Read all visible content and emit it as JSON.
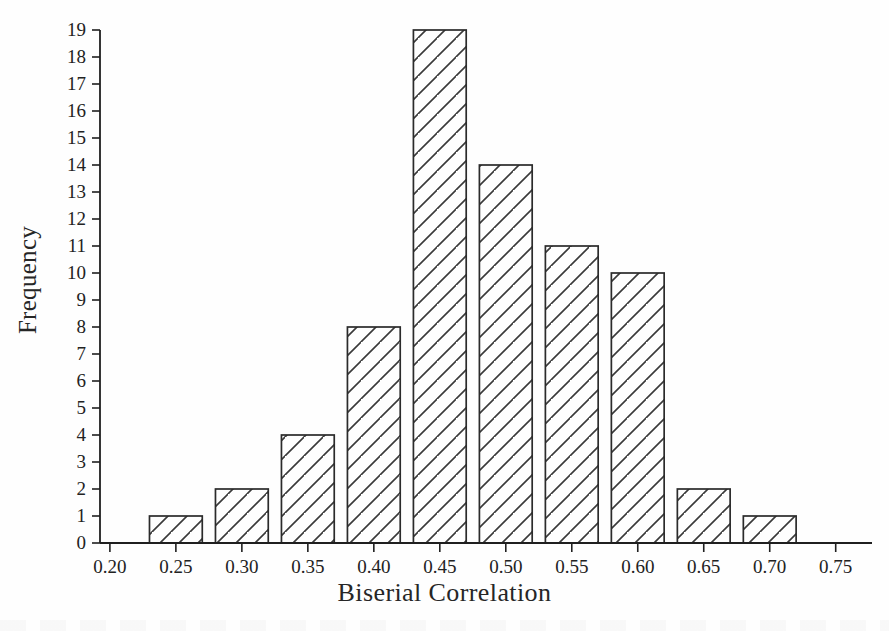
{
  "figure": {
    "background": "#fefefe",
    "ink_color": "#1a1a1a",
    "bar_fill": "#ffffff",
    "bar_edge": "#2b2b2b",
    "hatch_color": "#3a3a3a"
  },
  "axis_titles": {
    "x": "Biserial Correlation",
    "y": "Frequency"
  },
  "chart_data": {
    "type": "bar",
    "title": "",
    "subtitle": "",
    "xlabel": "Biserial Correlation",
    "ylabel": "Frequency",
    "categories": [
      "0.25",
      "0.30",
      "0.35",
      "0.40",
      "0.45",
      "0.50",
      "0.55",
      "0.60",
      "0.65",
      "0.70"
    ],
    "x": [
      0.25,
      0.3,
      0.35,
      0.4,
      0.45,
      0.5,
      0.55,
      0.6,
      0.65,
      0.7
    ],
    "values": [
      1,
      2,
      4,
      8,
      19,
      14,
      11,
      10,
      2,
      1
    ],
    "bar_width": 0.04,
    "bin_centers_on_ticks": true,
    "xlim": [
      0.1925,
      0.7775
    ],
    "ylim": [
      0,
      19
    ],
    "xticks": [
      0.2,
      0.25,
      0.3,
      0.35,
      0.4,
      0.45,
      0.5,
      0.55,
      0.6,
      0.65,
      0.7,
      0.75
    ],
    "xticklabels": [
      "0.20",
      "0.25",
      "0.30",
      "0.35",
      "0.40",
      "0.45",
      "0.50",
      "0.55",
      "0.60",
      "0.65",
      "0.70",
      "0.75"
    ],
    "yticks": [
      0,
      1,
      2,
      3,
      4,
      5,
      6,
      7,
      8,
      9,
      10,
      11,
      12,
      13,
      14,
      15,
      16,
      17,
      18,
      19
    ],
    "yticklabels": [
      "0",
      "1",
      "2",
      "3",
      "4",
      "5",
      "6",
      "7",
      "8",
      "9",
      "10",
      "11",
      "12",
      "13",
      "14",
      "15",
      "16",
      "17",
      "18",
      "19"
    ],
    "grid": false,
    "legend": null,
    "fill_pattern": "diagonal-hatch",
    "annotations": []
  }
}
